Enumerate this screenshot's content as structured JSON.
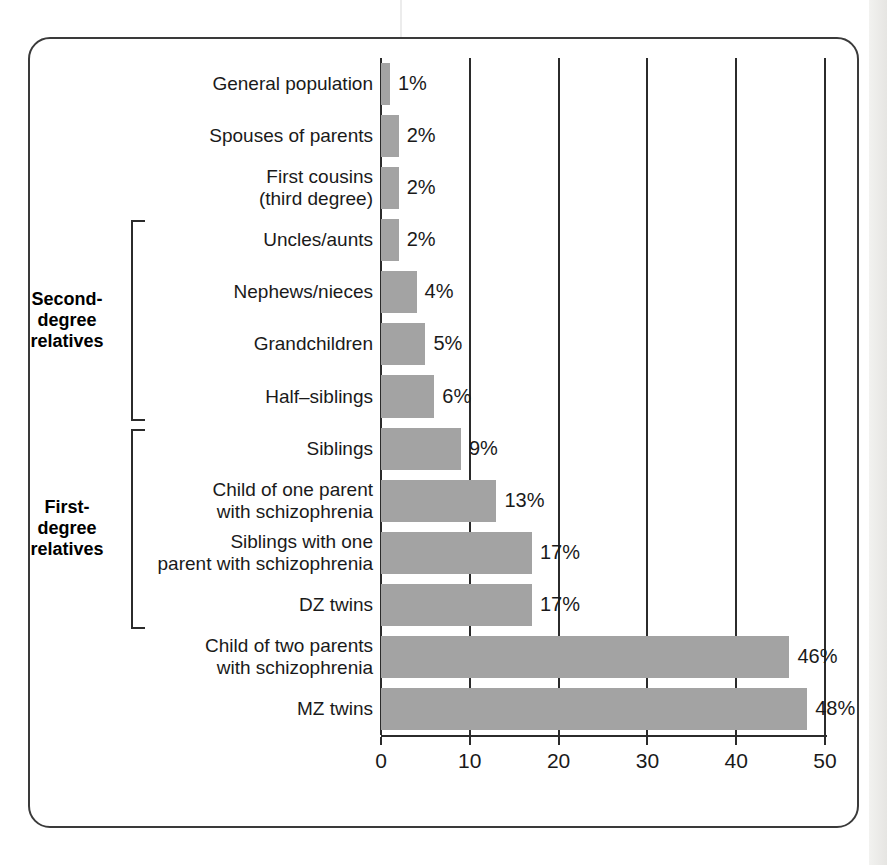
{
  "chart_data": {
    "type": "bar",
    "orientation": "horizontal",
    "title": "",
    "xlabel": "Lifetime risk of developing schizophrenia\n(in percents)",
    "ylabel": "",
    "xlim": [
      0,
      50
    ],
    "xticks": [
      "0",
      "10",
      "20",
      "30",
      "40",
      "50"
    ],
    "xtick_values": [
      0,
      10,
      20,
      30,
      40,
      50
    ],
    "grid": "vertical gridlines at each x tick",
    "legend": "none",
    "bar_color": "#a3a3a3",
    "categories": [
      "General population",
      "Spouses of parents",
      "First cousins\n(third degree)",
      "Uncles/aunts",
      "Nephews/nieces",
      "Grandchildren",
      "Half–siblings",
      "Siblings",
      "Child of one parent\nwith schizophrenia",
      "Siblings with one\nparent with schizophrenia",
      "DZ twins",
      "Child of two parents\nwith schizophrenia",
      "MZ twins"
    ],
    "values": [
      1,
      2,
      2,
      2,
      4,
      5,
      6,
      9,
      13,
      17,
      17,
      46,
      48
    ],
    "value_labels": [
      "1%",
      "2%",
      "2%",
      "2%",
      "4%",
      "5%",
      "6%",
      "9%",
      "13%",
      "17%",
      "17%",
      "46%",
      "48%"
    ],
    "annotations": [
      {
        "label": "Second-\ndegree\nrelatives",
        "spans_categories": [
          "Uncles/aunts",
          "Nephews/nieces",
          "Grandchildren",
          "Half–siblings"
        ]
      },
      {
        "label": "First-\ndegree\nrelatives",
        "spans_categories": [
          "Siblings",
          "Child of one parent with schizophrenia",
          "Siblings with one parent with schizophrenia",
          "DZ twins"
        ]
      }
    ]
  }
}
